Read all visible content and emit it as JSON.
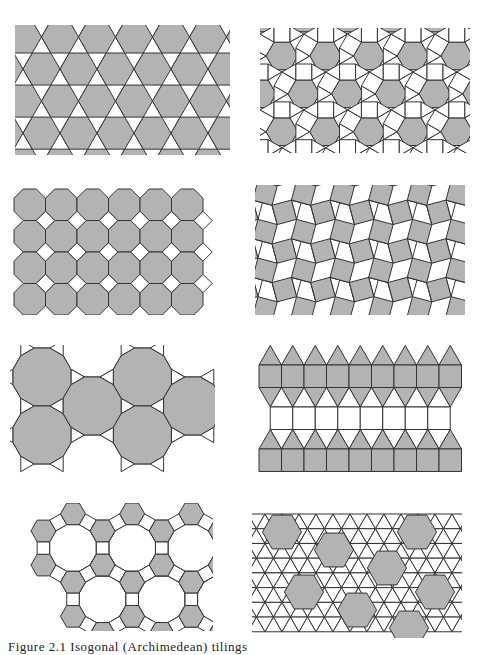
{
  "figure": {
    "caption": "Figure 2.1   Isogonal (Archimedean) tilings",
    "fill_shaded": "#b3b3b3",
    "fill_white": "#ffffff",
    "stroke": "#333333"
  },
  "panels": [
    {
      "id": "trihexagonal",
      "vertex_config": "3.6.3.6",
      "x": 15,
      "y": 25,
      "w": 215,
      "h": 130
    },
    {
      "id": "rhombitrihexagonal",
      "vertex_config": "3.4.6.4",
      "x": 260,
      "y": 28,
      "w": 210,
      "h": 125
    },
    {
      "id": "truncated-square",
      "vertex_config": "4.8.8",
      "x": 10,
      "y": 185,
      "w": 205,
      "h": 130
    },
    {
      "id": "snub-square",
      "vertex_config": "3.3.4.3.4",
      "x": 255,
      "y": 185,
      "w": 210,
      "h": 130
    },
    {
      "id": "truncated-hexagonal",
      "vertex_config": "3.12.12",
      "x": 10,
      "y": 345,
      "w": 205,
      "h": 130
    },
    {
      "id": "elongated-triangular",
      "vertex_config": "3.3.3.4.4",
      "x": 253,
      "y": 345,
      "w": 210,
      "h": 128
    },
    {
      "id": "truncated-trihexagonal",
      "vertex_config": "4.6.12",
      "x": 8,
      "y": 503,
      "w": 205,
      "h": 128
    },
    {
      "id": "snub-hexagonal",
      "vertex_config": "3.3.3.3.6",
      "x": 252,
      "y": 510,
      "w": 210,
      "h": 128
    }
  ]
}
